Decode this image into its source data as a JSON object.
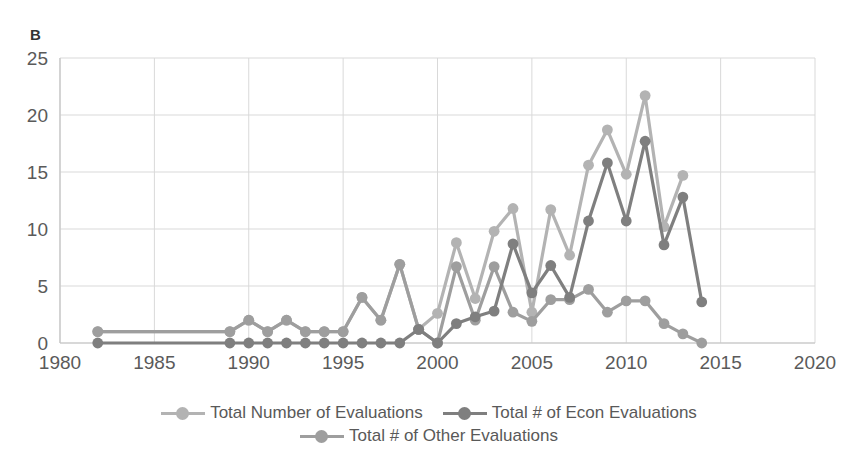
{
  "panel": {
    "label": "B"
  },
  "colors": {
    "total": "#b3b3b3",
    "econ": "#7f7f7f",
    "other": "#9e9e9e",
    "grid": "#d9d9d9",
    "text": "#5a5a5a"
  },
  "legend": {
    "items": [
      {
        "label": "Total Number of Evaluations",
        "color_key": "total",
        "icon": "line-marker-icon"
      },
      {
        "label": "Total # of Econ Evaluations",
        "color_key": "econ",
        "icon": "line-marker-icon"
      },
      {
        "label": "Total # of Other Evaluations",
        "color_key": "other",
        "icon": "line-marker-icon"
      }
    ]
  },
  "chart_data": {
    "type": "line",
    "title": "B",
    "xlabel": "",
    "ylabel": "",
    "xlim": [
      1980,
      2020
    ],
    "ylim": [
      0,
      25
    ],
    "xticks": [
      1980,
      1985,
      1990,
      1995,
      2000,
      2005,
      2010,
      2015,
      2020
    ],
    "yticks": [
      0,
      5,
      10,
      15,
      20,
      25
    ],
    "grid": true,
    "legend_position": "bottom",
    "x": [
      1982,
      1989,
      1990,
      1991,
      1992,
      1993,
      1994,
      1995,
      1996,
      1997,
      1998,
      1999,
      2000,
      2001,
      2002,
      2003,
      2004,
      2005,
      2006,
      2007,
      2008,
      2009,
      2010,
      2011,
      2012,
      2013,
      2014
    ],
    "series": [
      {
        "name": "Total Number of Evaluations",
        "color": "#b3b3b3",
        "values": [
          1,
          1,
          2,
          1,
          2,
          1,
          1,
          1,
          4,
          2,
          6.9,
          1.2,
          2.6,
          8.8,
          3.9,
          9.8,
          11.8,
          2.7,
          11.7,
          7.7,
          15.6,
          18.7,
          14.8,
          21.7,
          10.2,
          14.7,
          null
        ]
      },
      {
        "name": "Total # of Econ Evaluations",
        "color": "#7f7f7f",
        "values": [
          0,
          0,
          0,
          0,
          0,
          0,
          0,
          0,
          0,
          0,
          0,
          1.2,
          0,
          1.7,
          2.3,
          2.8,
          8.7,
          4.4,
          6.8,
          4.0,
          10.7,
          15.8,
          10.7,
          17.7,
          8.6,
          12.8,
          3.6
        ]
      },
      {
        "name": "Total # of Other Evaluations",
        "color": "#9e9e9e",
        "values": [
          1,
          1,
          2,
          1,
          2,
          1,
          1,
          1,
          4,
          2,
          6.9,
          1.2,
          0,
          6.7,
          2.0,
          6.7,
          2.7,
          1.9,
          3.8,
          3.8,
          4.7,
          2.7,
          3.7,
          3.7,
          1.7,
          0.8,
          0
        ]
      }
    ]
  }
}
